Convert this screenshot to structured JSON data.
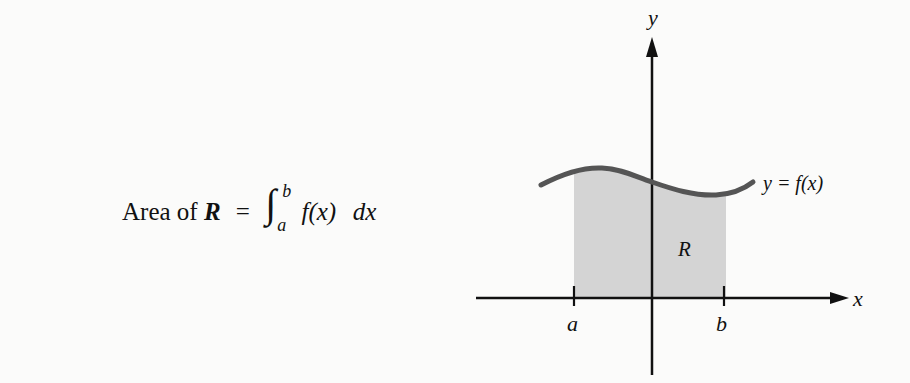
{
  "formula": {
    "prefix": "Area of",
    "region": "R",
    "equals": "=",
    "integral_sign": "∫",
    "upper_limit": "b",
    "lower_limit": "a",
    "integrand": "f(x)",
    "differential": "dx"
  },
  "graph": {
    "y_axis_label": "y",
    "x_axis_label": "x",
    "tick_a_label": "a",
    "tick_b_label": "b",
    "curve_label": "y = f(x)",
    "region_label": "R",
    "colors": {
      "axes": "#111111",
      "curve": "#555555",
      "region_fill": "#d4d4d4",
      "background": "#fbfbfa"
    }
  }
}
